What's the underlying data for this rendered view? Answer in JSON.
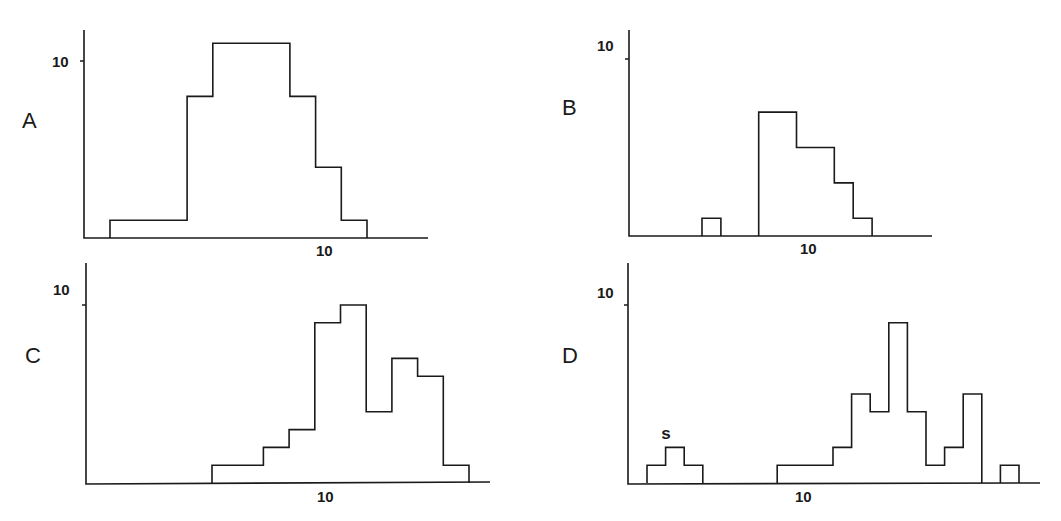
{
  "figure": {
    "panels": [
      {
        "id": "A",
        "letter": "A",
        "y_tick_label": "10",
        "x_tick_label": "10"
      },
      {
        "id": "B",
        "letter": "B",
        "y_tick_label": "10",
        "x_tick_label": "10"
      },
      {
        "id": "C",
        "letter": "C",
        "y_tick_label": "10",
        "x_tick_label": "10"
      },
      {
        "id": "D",
        "letter": "D",
        "y_tick_label": "10",
        "x_tick_label": "10",
        "annotation": "s"
      }
    ]
  },
  "chart_data": [
    {
      "type": "bar",
      "title": "A",
      "xlabel": "",
      "ylabel": "",
      "x_tick": 10,
      "y_tick": 10,
      "bins": [
        1,
        2,
        3,
        4,
        5,
        6,
        7,
        8,
        9,
        10,
        11,
        12,
        13
      ],
      "values": [
        1,
        1,
        1,
        8,
        11,
        11,
        11,
        8,
        4,
        1
      ],
      "bin_start": 1,
      "ylim": [
        0,
        12
      ],
      "grid": false
    },
    {
      "type": "bar",
      "title": "B",
      "xlabel": "",
      "ylabel": "",
      "x_tick": 10,
      "y_tick": 10,
      "values": [
        1,
        0,
        0,
        7,
        7,
        5,
        5,
        3,
        1
      ],
      "bin_start": 5,
      "ylim": [
        0,
        12
      ],
      "grid": false
    },
    {
      "type": "bar",
      "title": "C",
      "xlabel": "",
      "ylabel": "",
      "x_tick": 10,
      "y_tick": 10,
      "values": [
        1,
        1,
        2,
        3,
        9,
        10,
        4,
        7,
        6,
        1
      ],
      "bin_start": 6,
      "ylim": [
        0,
        12
      ],
      "grid": false
    },
    {
      "type": "bar",
      "title": "D",
      "xlabel": "",
      "ylabel": "",
      "x_tick": 10,
      "y_tick": 10,
      "values": [
        1,
        2,
        1,
        0,
        0,
        0,
        0,
        1,
        1,
        1,
        2,
        5,
        4,
        9,
        4,
        1,
        2,
        5,
        0,
        1
      ],
      "bin_start": 2,
      "annotations": [
        {
          "text": "s",
          "over_bin_value": 2
        }
      ],
      "ylim": [
        0,
        12
      ],
      "grid": false
    }
  ]
}
